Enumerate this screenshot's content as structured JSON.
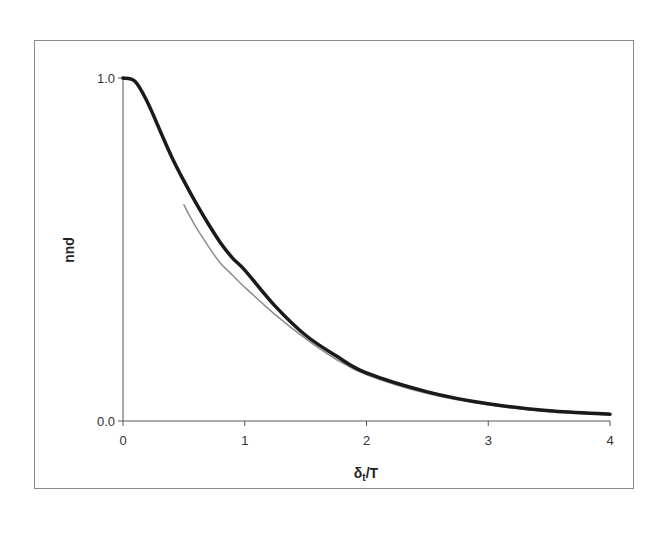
{
  "chart_data": {
    "type": "line",
    "title": "",
    "xlabel": "δt/T",
    "xlabel_main": "δ",
    "xlabel_sub": "t",
    "xlabel_tail": "/T",
    "ylabel": "ρuu",
    "xlim": [
      0,
      4
    ],
    "ylim": [
      0.0,
      1.0
    ],
    "x_ticks": [
      0,
      1,
      2,
      3,
      4
    ],
    "x_tick_labels": [
      "0",
      "1",
      "2",
      "3",
      "4"
    ],
    "y_ticks": [
      0.0,
      1.0
    ],
    "y_tick_labels": [
      "0.0",
      "1.0"
    ],
    "grid": false,
    "legend": null,
    "series": [
      {
        "name": "correlation (thick black)",
        "color": "#1a1a1a",
        "width": 3.5,
        "x": [
          0,
          0.1,
          0.2,
          0.3,
          0.4,
          0.5,
          0.6,
          0.7,
          0.8,
          0.9,
          1.0,
          1.25,
          1.5,
          1.75,
          2.0,
          2.5,
          3.0,
          3.5,
          4.0
        ],
        "y": [
          1.0,
          0.99,
          0.93,
          0.85,
          0.77,
          0.7,
          0.635,
          0.575,
          0.52,
          0.475,
          0.44,
          0.335,
          0.25,
          0.19,
          0.14,
          0.085,
          0.05,
          0.03,
          0.02
        ]
      },
      {
        "name": "asymptotic fit (thin gray)",
        "color": "#8c8c8c",
        "width": 1.5,
        "x": [
          0.5,
          0.6,
          0.7,
          0.8,
          0.9,
          1.0,
          1.25,
          1.5,
          1.75,
          2.0,
          2.5,
          3.0,
          3.5,
          4.0
        ],
        "y": [
          0.63,
          0.565,
          0.51,
          0.46,
          0.425,
          0.39,
          0.31,
          0.24,
          0.18,
          0.135,
          0.08,
          0.047,
          0.028,
          0.017
        ]
      }
    ]
  },
  "axes": {
    "x_tick_labels": [
      "0",
      "1",
      "2",
      "3",
      "4"
    ],
    "y_tick_labels": [
      "0.0",
      "1.0"
    ],
    "xlabel_main": "δ",
    "xlabel_sub": "t",
    "xlabel_tail": "/T",
    "ylabel": "ρuu"
  }
}
